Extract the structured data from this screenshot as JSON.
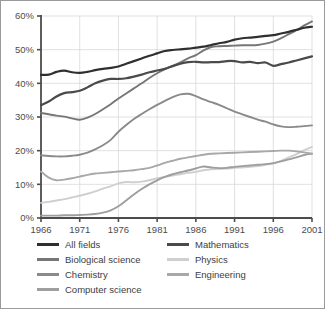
{
  "chart_data": {
    "type": "line",
    "title": "",
    "xlabel": "",
    "ylabel": "",
    "xlim": [
      1966,
      2001
    ],
    "ylim": [
      0,
      60
    ],
    "grid": true,
    "legend_position": "bottom",
    "x_ticks": [
      "1966",
      "1971",
      "1976",
      "1981",
      "1986",
      "1991",
      "1996",
      "2001"
    ],
    "y_ticks": [
      "0%",
      "10%",
      "20%",
      "30%",
      "40%",
      "50%",
      "60%"
    ],
    "x": [
      1966,
      1967,
      1968,
      1969,
      1970,
      1971,
      1972,
      1973,
      1974,
      1975,
      1976,
      1977,
      1978,
      1979,
      1980,
      1981,
      1982,
      1983,
      1984,
      1985,
      1986,
      1987,
      1988,
      1989,
      1990,
      1991,
      1992,
      1993,
      1994,
      1995,
      1996,
      1997,
      1998,
      1999,
      2000,
      2001
    ],
    "series": [
      {
        "name": "All fields",
        "color": "#2f2f2f",
        "values": [
          42.5,
          42.6,
          43.4,
          43.8,
          43.3,
          43.1,
          43.4,
          43.9,
          44.3,
          44.6,
          45.0,
          45.8,
          46.6,
          47.4,
          48.2,
          48.9,
          49.6,
          49.9,
          50.1,
          50.3,
          50.6,
          50.9,
          51.4,
          51.9,
          52.3,
          53.0,
          53.4,
          53.6,
          53.8,
          54.1,
          54.3,
          54.8,
          55.3,
          55.9,
          56.5,
          56.8
        ]
      },
      {
        "name": "Mathematics",
        "color": "#4a4a4a",
        "values": [
          33.5,
          34.6,
          36.1,
          37.1,
          37.4,
          37.8,
          38.8,
          40.0,
          40.8,
          41.3,
          41.3,
          41.5,
          42.0,
          42.6,
          43.3,
          43.8,
          44.3,
          45.1,
          45.8,
          46.3,
          46.4,
          46.2,
          46.3,
          46.3,
          46.6,
          46.6,
          46.2,
          46.4,
          46.0,
          46.2,
          45.2,
          45.7,
          46.2,
          46.8,
          47.4,
          48.0
        ]
      },
      {
        "name": "Biological science",
        "color": "#767676",
        "values": [
          31.2,
          30.8,
          30.4,
          30.1,
          29.6,
          29.2,
          29.8,
          30.9,
          32.3,
          33.8,
          35.5,
          37.0,
          38.5,
          40.0,
          41.6,
          43.0,
          44.2,
          45.2,
          46.2,
          47.4,
          48.4,
          49.8,
          50.8,
          51.0,
          51.1,
          51.2,
          51.3,
          51.3,
          51.4,
          51.8,
          52.4,
          53.4,
          54.6,
          55.8,
          57.2,
          58.4
        ]
      },
      {
        "name": "Chemistry",
        "color": "#8a8a8a",
        "values": [
          18.6,
          18.4,
          18.3,
          18.3,
          18.5,
          18.8,
          19.4,
          20.4,
          21.6,
          23.2,
          25.6,
          27.6,
          29.4,
          30.9,
          32.3,
          33.6,
          34.8,
          35.9,
          36.7,
          36.9,
          36.2,
          35.2,
          34.4,
          33.6,
          32.6,
          31.6,
          30.8,
          30.0,
          29.2,
          28.6,
          27.8,
          27.2,
          27.0,
          27.1,
          27.3,
          27.5
        ]
      },
      {
        "name": "Computer science",
        "color": "#9e9e9e",
        "values": [
          0.7,
          0.7,
          0.7,
          0.8,
          0.8,
          0.9,
          1.0,
          1.2,
          1.6,
          2.3,
          3.5,
          5.2,
          7.0,
          8.6,
          10.0,
          11.2,
          12.2,
          13.0,
          13.6,
          14.1,
          14.7,
          15.3,
          15.0,
          14.8,
          14.9,
          15.2,
          15.4,
          15.6,
          15.8,
          16.0,
          16.3,
          16.8,
          17.4,
          18.0,
          18.7,
          19.1
        ]
      },
      {
        "name": "Physics",
        "color": "#cfcfcf",
        "values": [
          4.5,
          4.8,
          5.2,
          5.6,
          6.1,
          6.6,
          7.2,
          7.9,
          8.7,
          9.4,
          10.3,
          10.7,
          10.6,
          10.8,
          11.2,
          11.8,
          12.2,
          12.6,
          13.0,
          13.4,
          13.7,
          14.2,
          14.5,
          14.6,
          14.7,
          14.9,
          15.0,
          15.2,
          15.4,
          15.8,
          16.2,
          17.0,
          18.0,
          19.0,
          20.2,
          21.1
        ]
      },
      {
        "name": "Engineering",
        "color": "#a8a8a8",
        "values": [
          13.8,
          12.0,
          11.2,
          11.4,
          11.8,
          12.3,
          12.8,
          13.2,
          13.4,
          13.6,
          13.8,
          14.0,
          14.2,
          14.5,
          14.9,
          15.6,
          16.4,
          17.0,
          17.6,
          18.0,
          18.4,
          18.8,
          19.1,
          19.2,
          19.3,
          19.4,
          19.5,
          19.6,
          19.7,
          19.8,
          19.9,
          20.0,
          20.0,
          19.8,
          19.5,
          19.1
        ]
      }
    ]
  },
  "legend": {
    "left_column": [
      {
        "label": "All fields",
        "color": "#2f2f2f",
        "thickness": 3.2
      },
      {
        "label": "Biological science",
        "color": "#767676",
        "thickness": 3
      },
      {
        "label": "Chemistry",
        "color": "#8a8a8a",
        "thickness": 3
      },
      {
        "label": "Computer science",
        "color": "#9e9e9e",
        "thickness": 3
      }
    ],
    "right_column": [
      {
        "label": "Mathematics",
        "color": "#4a4a4a",
        "thickness": 3.2
      },
      {
        "label": "Physics",
        "color": "#cfcfcf",
        "thickness": 3
      },
      {
        "label": "Engineering",
        "color": "#a8a8a8",
        "thickness": 3
      }
    ]
  },
  "style": {
    "background": "#ffffff",
    "border_color": "#9a9a9a",
    "grid_color": "#d8d8d8",
    "axis_color": "#4c4c4c",
    "tick_text_color": "#4c4c4c"
  }
}
